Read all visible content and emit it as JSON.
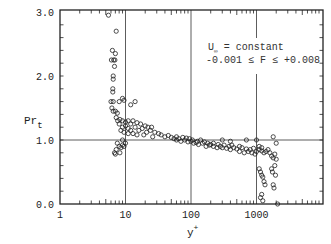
{
  "chart_data": {
    "type": "scatter",
    "title": "",
    "xlabel": "y+",
    "ylabel": "Pr_t",
    "xscale": "log",
    "xlim": [
      1,
      10000
    ],
    "ylim": [
      0.0,
      3.0
    ],
    "x_tick_labels": [
      "1",
      "10",
      "100",
      "1000"
    ],
    "y_tick_labels": [
      "0.0",
      "1.0",
      "2.0",
      "3.0"
    ],
    "grid": {
      "vertical_at": [
        10,
        100,
        1000
      ],
      "horizontal_at": [
        1.0
      ]
    },
    "legend": null,
    "annotations": [
      "U∞ = constant",
      "-0.001 ≤ F ≤ +0.008"
    ],
    "series": [
      {
        "name": "Pr_t data",
        "marker": "open-circle",
        "points": [
          [
            5.5,
            2.95
          ],
          [
            7.2,
            2.7
          ],
          [
            6.3,
            2.4
          ],
          [
            7.0,
            2.35
          ],
          [
            6.1,
            2.25
          ],
          [
            6.6,
            2.25
          ],
          [
            6.9,
            2.25
          ],
          [
            6.8,
            2.15
          ],
          [
            6.5,
            2.0
          ],
          [
            6.5,
            1.95
          ],
          [
            6.4,
            1.8
          ],
          [
            6.4,
            1.75
          ],
          [
            6.0,
            1.6
          ],
          [
            6.5,
            1.6
          ],
          [
            6.2,
            1.5
          ],
          [
            6.5,
            1.45
          ],
          [
            7.0,
            1.45
          ],
          [
            7.5,
            1.42
          ],
          [
            8.0,
            1.6
          ],
          [
            9.0,
            1.65
          ],
          [
            9.5,
            1.62
          ],
          [
            12,
            1.55
          ],
          [
            14,
            1.6
          ],
          [
            7.2,
            1.35
          ],
          [
            7.6,
            1.3
          ],
          [
            8.2,
            1.32
          ],
          [
            9,
            1.3
          ],
          [
            10,
            1.28
          ],
          [
            11,
            1.3
          ],
          [
            12,
            1.25
          ],
          [
            13,
            1.3
          ],
          [
            15,
            1.27
          ],
          [
            17,
            1.25
          ],
          [
            20,
            1.22
          ],
          [
            22,
            1.2
          ],
          [
            25,
            1.2
          ],
          [
            8,
            1.25
          ],
          [
            9,
            1.2
          ],
          [
            10,
            1.22
          ],
          [
            11,
            1.18
          ],
          [
            12,
            1.15
          ],
          [
            14,
            1.2
          ],
          [
            16,
            1.15
          ],
          [
            18,
            1.18
          ],
          [
            21,
            1.12
          ],
          [
            24,
            1.15
          ],
          [
            28,
            1.12
          ],
          [
            32,
            1.1
          ],
          [
            8.5,
            1.15
          ],
          [
            9.5,
            1.12
          ],
          [
            11,
            1.1
          ],
          [
            13,
            1.1
          ],
          [
            15,
            1.08
          ],
          [
            19,
            1.08
          ],
          [
            26,
            1.05
          ],
          [
            35,
            1.08
          ],
          [
            40,
            1.05
          ],
          [
            45,
            1.07
          ],
          [
            50,
            1.04
          ],
          [
            7.5,
            0.95
          ],
          [
            8,
            0.9
          ],
          [
            8.5,
            0.88
          ],
          [
            9,
            0.92
          ],
          [
            9.5,
            0.9
          ],
          [
            10,
            0.95
          ],
          [
            7.2,
            0.85
          ],
          [
            6.8,
            0.8
          ],
          [
            8.2,
            0.8
          ],
          [
            7.0,
            0.78
          ],
          [
            9,
            1.0
          ],
          [
            55,
            1.02
          ],
          [
            60,
            1.0
          ],
          [
            65,
            1.02
          ],
          [
            70,
            0.98
          ],
          [
            80,
            1.0
          ],
          [
            90,
            0.97
          ],
          [
            100,
            0.98
          ],
          [
            110,
            0.95
          ],
          [
            120,
            0.96
          ],
          [
            130,
            0.93
          ],
          [
            150,
            0.95
          ],
          [
            60,
            1.05
          ],
          [
            75,
            1.04
          ],
          [
            85,
            1.03
          ],
          [
            95,
            1.02
          ],
          [
            105,
            1.0
          ],
          [
            125,
            0.98
          ],
          [
            140,
            1.0
          ],
          [
            160,
            0.97
          ],
          [
            180,
            0.95
          ],
          [
            200,
            0.93
          ],
          [
            170,
            0.9
          ],
          [
            190,
            0.92
          ],
          [
            220,
            0.9
          ],
          [
            250,
            0.88
          ],
          [
            280,
            0.9
          ],
          [
            300,
            0.88
          ],
          [
            350,
            0.87
          ],
          [
            400,
            0.85
          ],
          [
            450,
            0.88
          ],
          [
            500,
            0.86
          ],
          [
            220,
            0.95
          ],
          [
            260,
            0.93
          ],
          [
            320,
            0.92
          ],
          [
            380,
            0.9
          ],
          [
            420,
            0.92
          ],
          [
            550,
            0.9
          ],
          [
            600,
            0.88
          ],
          [
            700,
            0.86
          ],
          [
            800,
            0.85
          ],
          [
            900,
            0.87
          ],
          [
            550,
            0.82
          ],
          [
            650,
            0.8
          ],
          [
            750,
            0.82
          ],
          [
            850,
            0.8
          ],
          [
            950,
            0.78
          ],
          [
            1000,
            0.82
          ],
          [
            1100,
            0.85
          ],
          [
            1200,
            0.83
          ],
          [
            1300,
            0.8
          ],
          [
            1400,
            0.82
          ],
          [
            1100,
            0.9
          ],
          [
            1200,
            0.88
          ],
          [
            1500,
            0.85
          ],
          [
            1600,
            0.8
          ],
          [
            1700,
            0.75
          ],
          [
            1800,
            0.72
          ],
          [
            1900,
            0.78
          ],
          [
            2000,
            0.7
          ],
          [
            1800,
            1.05
          ],
          [
            2000,
            0.95
          ],
          [
            1100,
            0.55
          ],
          [
            1150,
            0.5
          ],
          [
            1200,
            0.45
          ],
          [
            1250,
            0.42
          ],
          [
            1300,
            0.35
          ],
          [
            1350,
            0.3
          ],
          [
            1700,
            0.55
          ],
          [
            1750,
            0.5
          ],
          [
            1800,
            0.3
          ],
          [
            1850,
            0.25
          ],
          [
            1200,
            0.15
          ],
          [
            1150,
            0.1
          ],
          [
            1250,
            0.05
          ],
          [
            2100,
            0.0
          ],
          [
            1900,
            0.6
          ],
          [
            1950,
            0.45
          ],
          [
            1000,
            1.0
          ],
          [
            400,
            0.98
          ],
          [
            300,
            1.0
          ],
          [
            700,
            1.0
          ]
        ]
      }
    ]
  },
  "axes": {
    "y_label_main": "Pr",
    "y_label_sub": "t",
    "x_label_main": "y",
    "x_label_sup": "+",
    "annotation_line1_prefix": "U",
    "annotation_line1_sub": "∞",
    "annotation_line1_rest": " = constant",
    "annotation_line2": "-0.001 ≤ F ≤ +0.008"
  }
}
